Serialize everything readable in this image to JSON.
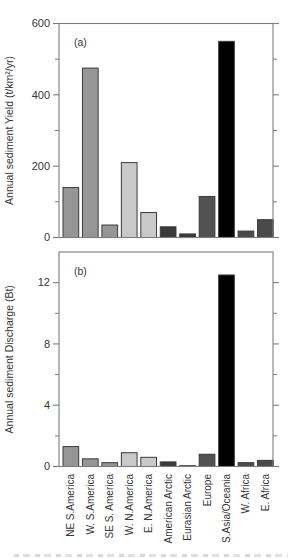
{
  "figure": {
    "description_visible_text_only": "two stacked bar chart panels sharing one category axis",
    "panels": [
      "(a)",
      "(b)"
    ]
  },
  "chart_data": [
    {
      "type": "bar",
      "panel": "a",
      "panel_label": "(a)",
      "ylabel": "Annual sediment Yield (t/km²/yr)",
      "categories": [
        "NE S.America",
        "W. S.America",
        "SE S. America",
        "W. N.America",
        "E. N.America",
        "American Arctic",
        "Eurasian Arctic",
        "Europe",
        "S.Asia/Oceania",
        "W. Africa",
        "E. Africa"
      ],
      "values": [
        140,
        475,
        35,
        210,
        70,
        30,
        10,
        115,
        550,
        18,
        50
      ],
      "ylim": [
        0,
        600
      ],
      "yticks": [
        0,
        200,
        400,
        600
      ],
      "minor_yticks": [
        100,
        300,
        500
      ],
      "grid": false,
      "legend": "none",
      "bar_colors": [
        "#969696",
        "#969696",
        "#969696",
        "#c9c9c9",
        "#c9c9c9",
        "#3a3a3a",
        "#3a3a3a",
        "#525252",
        "#000000",
        "#4a4a4a",
        "#4a4a4a"
      ]
    },
    {
      "type": "bar",
      "panel": "b",
      "panel_label": "(b)",
      "ylabel": "Annual sediment Discharge (Bt)",
      "categories": [
        "NE S.America",
        "W. S.America",
        "SE S. America",
        "W. N.America",
        "E. N.America",
        "American Arctic",
        "Eurasian Arctic",
        "Europe",
        "S.Asia/Oceania",
        "W. Africa",
        "E. Africa"
      ],
      "values": [
        1.3,
        0.5,
        0.25,
        0.9,
        0.6,
        0.3,
        0.05,
        0.8,
        12.5,
        0.25,
        0.4
      ],
      "ylim": [
        0,
        14
      ],
      "yticks": [
        0,
        4,
        8,
        12
      ],
      "minor_yticks": [
        2,
        6,
        10
      ],
      "grid": false,
      "legend": "none",
      "bar_colors": [
        "#969696",
        "#969696",
        "#969696",
        "#c9c9c9",
        "#c9c9c9",
        "#3a3a3a",
        "#3a3a3a",
        "#525252",
        "#000000",
        "#4a4a4a",
        "#4a4a4a"
      ]
    }
  ],
  "style": {
    "bar_stroke": "#3c3c3c",
    "axis_color": "#7d7d7d",
    "text_color": "#353535",
    "background": "#ffffff"
  }
}
